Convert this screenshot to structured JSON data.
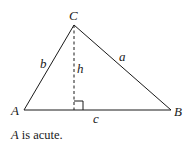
{
  "diagram": {
    "type": "triangle",
    "vertices": {
      "A": {
        "label": "A",
        "x": 24,
        "y": 110
      },
      "B": {
        "label": "B",
        "x": 171,
        "y": 110
      },
      "C": {
        "label": "C",
        "x": 74,
        "y": 25
      }
    },
    "sides": {
      "a": {
        "label": "a"
      },
      "b": {
        "label": "b"
      },
      "c": {
        "label": "c"
      }
    },
    "altitude": {
      "label": "h",
      "style": "dashed"
    },
    "right_angle_marker": true,
    "colors": {
      "stroke": "#1a1a1a",
      "background": "#ffffff"
    }
  },
  "caption": {
    "variable": "A",
    "text": " is acute."
  }
}
